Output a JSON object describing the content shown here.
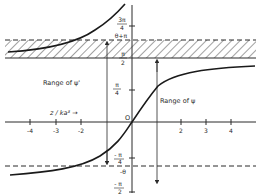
{
  "figure": {
    "x_axis_label": "z / ka³ →",
    "origin_label": "O",
    "x_ticks": [
      {
        "label": "-4",
        "x": 30
      },
      {
        "label": "-3",
        "x": 56
      },
      {
        "label": "-2",
        "x": 81
      },
      {
        "label": "2",
        "x": 181
      },
      {
        "label": "3",
        "x": 206
      },
      {
        "label": "4",
        "x": 231
      }
    ],
    "y_labels": {
      "three_pi_over_4_num": "3π",
      "three_pi_over_4_den": "4",
      "theta_plus_pi": "θ+π",
      "pi_over_2_num": "π",
      "pi_over_2_den": "2",
      "pi_over_4_num": "π",
      "pi_over_4_den": "4",
      "neg_pi_over_4_num": "- π",
      "neg_pi_over_4_den": "4",
      "neg_theta": "-θ",
      "neg_pi_over_2_num": "- π",
      "neg_pi_over_2_den": "2"
    },
    "annotations": {
      "range_psi_prime": "Range of ψ'",
      "range_psi": "Range of ψ"
    },
    "colors": {
      "ink": "#2a2a2a",
      "background": "#ffffff"
    }
  }
}
